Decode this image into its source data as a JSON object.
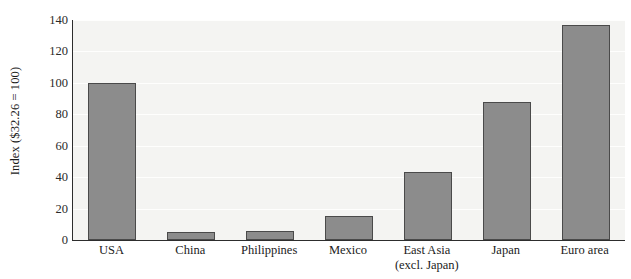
{
  "chart_data": {
    "type": "bar",
    "title": "",
    "subtitle": "",
    "xlabel": "",
    "ylabel": "Index ($32.26 = 100)",
    "categories": [
      "USA",
      "China",
      "Philippines",
      "Mexico",
      "East Asia (excl. Japan)",
      "Japan",
      "Euro area"
    ],
    "category_lines": [
      [
        "USA"
      ],
      [
        "China"
      ],
      [
        "Philippines"
      ],
      [
        "Mexico"
      ],
      [
        "East Asia",
        "(excl. Japan)"
      ],
      [
        "Japan"
      ],
      [
        "Euro area"
      ]
    ],
    "values": [
      100,
      5,
      6,
      15,
      43,
      88,
      137
    ],
    "ylim": [
      0,
      140
    ],
    "ytick_labels": [
      "0",
      "20",
      "40",
      "60",
      "80",
      "100",
      "120",
      "140"
    ],
    "ytick_values": [
      0,
      20,
      40,
      60,
      80,
      100,
      120,
      140
    ],
    "grid": "horizontal",
    "legend": "none",
    "bar_color": "#8c8c8c",
    "bar_border_color": "#4a4a4a",
    "plot_background": "#f4f4f2",
    "axis_color": "#2d2d2d"
  }
}
